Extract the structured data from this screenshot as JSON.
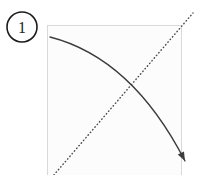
{
  "figure": {
    "kind": "instructional-step-diagram",
    "width": 198,
    "height": 175,
    "background_color": "#ffffff",
    "step": {
      "label": "1",
      "badge_shape": "circle",
      "badge_center_x": 22,
      "badge_center_y": 27,
      "badge_radius": 15,
      "badge_stroke_color": "#1c1c1c",
      "badge_stroke_width": 1.6,
      "badge_fill_color": "#ffffff",
      "text_color": "#1c1c1c"
    },
    "panel": {
      "name": "paper-sheet",
      "x": 47,
      "y": 25,
      "width": 134,
      "height": 158,
      "fill_color": "#fcfcfc",
      "border_color": "#d9d9d9",
      "border_width": 1
    },
    "guide_line": {
      "name": "fold-crease-diagonal",
      "style": "dotted",
      "color": "#4a4a4a",
      "width": 1.4,
      "dash_pattern": "0.5 3",
      "x1": 47,
      "y1": 183,
      "x2": 193,
      "y2": 13
    },
    "motion_arrow": {
      "name": "fold-motion-arrow",
      "style": "solid-curve",
      "color": "#3c3c3c",
      "width": 1.3,
      "start_x": 50,
      "start_y": 37,
      "control_x": 132,
      "control_y": 58,
      "end_x": 185,
      "end_y": 161,
      "head_length": 9,
      "head_width": 7,
      "head_color": "#3c3c3c"
    },
    "intersection": {
      "name": "crease-arrow-crossing",
      "x": 133,
      "y": 93
    }
  }
}
